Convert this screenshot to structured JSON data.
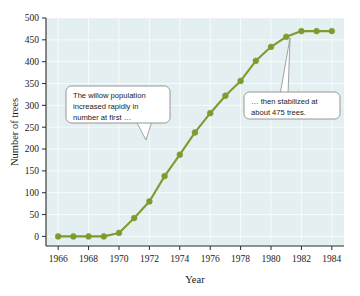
{
  "chart_data": {
    "type": "line",
    "title": "",
    "xlabel": "Year",
    "ylabel": "Number of trees",
    "x": [
      1966,
      1967,
      1968,
      1969,
      1970,
      1971,
      1972,
      1973,
      1974,
      1975,
      1976,
      1977,
      1978,
      1979,
      1980,
      1981,
      1982,
      1983,
      1984
    ],
    "values": [
      0,
      0,
      0,
      0,
      8,
      42,
      80,
      138,
      187,
      238,
      282,
      322,
      356,
      402,
      434,
      457,
      470,
      470,
      470
    ],
    "series": [
      {
        "name": "Willow trees",
        "values": [
          0,
          0,
          0,
          0,
          8,
          42,
          80,
          138,
          187,
          238,
          282,
          322,
          356,
          402,
          434,
          457,
          470,
          470,
          470
        ],
        "color": "#7d9c2f"
      }
    ],
    "xlim": [
      1965.2,
      1984.8
    ],
    "ylim": [
      -22,
      500
    ],
    "xticks": [
      1966,
      1968,
      1970,
      1972,
      1974,
      1976,
      1978,
      1980,
      1982,
      1984
    ],
    "xticklabels": [
      "1966",
      "1968",
      "1970",
      "1972",
      "1974",
      "1976",
      "1978",
      "1980",
      "1982",
      "1984"
    ],
    "yticks": [
      0,
      50,
      100,
      150,
      200,
      250,
      300,
      350,
      400,
      450,
      500
    ],
    "yticklabels": [
      "0",
      "50",
      "100",
      "150",
      "200",
      "250",
      "300",
      "350",
      "400",
      "450",
      "500"
    ],
    "grid": true,
    "legend": "none",
    "plot_background": "#e3eff0",
    "marker": "circle",
    "annotations": [
      {
        "id": "callout-growth",
        "lines": [
          "The willow population",
          "increased rapidly in",
          "number at first …"
        ],
        "points_to_year": 1973,
        "points_to_value": 138
      },
      {
        "id": "callout-plateau",
        "lines": [
          "… then  stabilized at",
          "about 475 trees."
        ],
        "points_to_year": 1982,
        "points_to_value": 470
      }
    ]
  },
  "axis": {
    "ylabel": "Number of trees",
    "xlabel": "Year"
  },
  "caption": {
    "text": ""
  }
}
